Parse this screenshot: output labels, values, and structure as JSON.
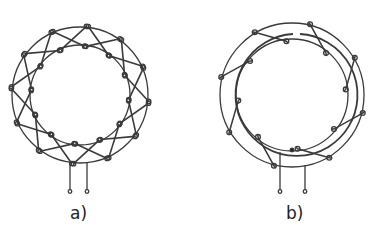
{
  "figures": [
    {
      "id": "a",
      "label": "a)",
      "description": "Toroidal core with bifilar crossed winding",
      "center": [
        80,
        95
      ],
      "outer_radius": 68,
      "inner_radius": 50,
      "turns": 12,
      "terminals": 2
    },
    {
      "id": "b",
      "label": "b)",
      "description": "Toroidal core with progressive winding and return conductor",
      "center": [
        292,
        95
      ],
      "outer_radius": 72,
      "inner_radius": 60,
      "turns": 8,
      "terminals": 2
    }
  ],
  "colors": {
    "stroke": "#3a3a3a",
    "background": "#ffffff"
  }
}
